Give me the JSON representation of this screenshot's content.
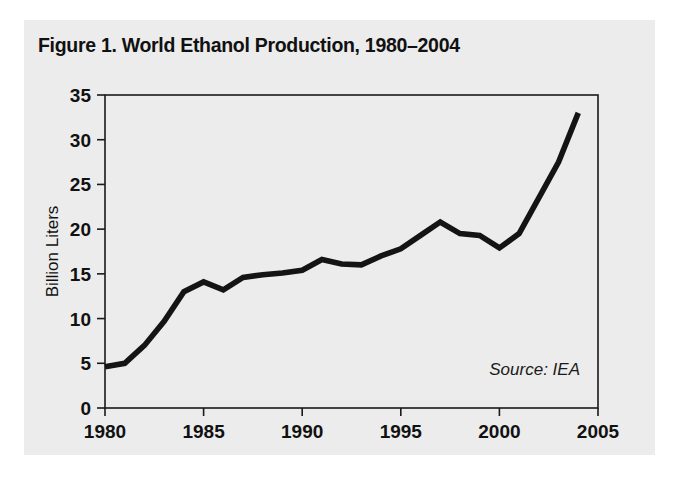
{
  "figure": {
    "title": "Figure 1. World Ethanol Production, 1980–2004",
    "source_note": "Source: IEA",
    "panel_background": "#ececec",
    "page_background": "#ffffff",
    "line_color": "#141414",
    "text_color": "#111111"
  },
  "chart_data": {
    "type": "line",
    "title": "Figure 1. World Ethanol Production, 1980–2004",
    "subtitle": "",
    "xlabel": "",
    "ylabel": "Billion Liters",
    "xlim": [
      1980,
      2005
    ],
    "ylim": [
      0,
      35
    ],
    "grid": false,
    "legend": false,
    "legend_position": "none",
    "annotations": [
      "Source: IEA"
    ],
    "xticks": [
      1980,
      1985,
      1990,
      1995,
      2000,
      2005
    ],
    "xtick_labels": [
      "1980",
      "1985",
      "1990",
      "1995",
      "2000",
      "2005"
    ],
    "yticks": [
      0,
      5,
      10,
      15,
      20,
      25,
      30,
      35
    ],
    "ytick_labels": [
      "0",
      "5",
      "10",
      "15",
      "20",
      "25",
      "30",
      "35"
    ],
    "x": [
      1980,
      1981,
      1982,
      1983,
      1984,
      1985,
      1986,
      1987,
      1988,
      1989,
      1990,
      1991,
      1992,
      1993,
      1994,
      1995,
      1996,
      1997,
      1998,
      1999,
      2000,
      2001,
      2002,
      2003,
      2004
    ],
    "values": [
      4.6,
      5.0,
      7.0,
      9.7,
      13.0,
      14.1,
      13.2,
      14.6,
      14.9,
      15.1,
      15.4,
      16.6,
      16.1,
      16.0,
      17.0,
      17.8,
      19.3,
      20.8,
      19.5,
      19.3,
      17.9,
      19.5,
      23.5,
      27.5,
      33.0
    ],
    "series": [
      {
        "name": "World Ethanol Production",
        "unit": "Billion Liters",
        "values": [
          4.6,
          5.0,
          7.0,
          9.7,
          13.0,
          14.1,
          13.2,
          14.6,
          14.9,
          15.1,
          15.4,
          16.6,
          16.1,
          16.0,
          17.0,
          17.8,
          19.3,
          20.8,
          19.5,
          19.3,
          17.9,
          19.5,
          23.5,
          27.5,
          33.0
        ]
      }
    ]
  }
}
